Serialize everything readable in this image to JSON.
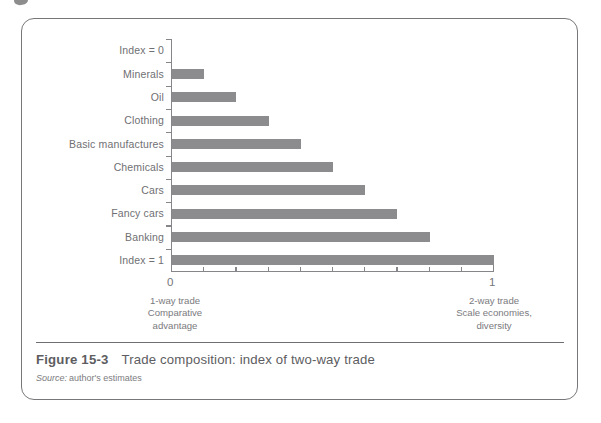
{
  "figure": {
    "number": "Figure 15-3",
    "title": "Trade composition: index of two-way trade",
    "source_label": "Source:",
    "source_text": "author's estimates",
    "border_color": "#77777a"
  },
  "chart_data": {
    "type": "bar",
    "orientation": "horizontal",
    "title": "Trade composition: index of two-way trade",
    "xlabel": "",
    "ylabel": "",
    "categories": [
      "Index = 0",
      "Minerals",
      "Oil",
      "Clothing",
      "Basic manufactures",
      "Chemicals",
      "Cars",
      "Fancy cars",
      "Banking",
      "Index = 1"
    ],
    "values": [
      0.0,
      0.1,
      0.2,
      0.3,
      0.4,
      0.5,
      0.6,
      0.7,
      0.8,
      1.0
    ],
    "xlim": [
      0,
      1
    ],
    "xticks": [
      0,
      0.1,
      0.2,
      0.3,
      0.4,
      0.5,
      0.6,
      0.7,
      0.8,
      0.9,
      1.0
    ],
    "xtick_labels": [
      "0",
      "",
      "",
      "",
      "",
      "",
      "",
      "",
      "",
      "",
      "1"
    ],
    "grid": false,
    "legend": null,
    "bar_color": "#8c8c8e",
    "axis_color": "#85858a",
    "annotations": [
      {
        "position": "left",
        "lines": [
          "1-way trade",
          "Comparative",
          "advantage"
        ]
      },
      {
        "position": "right",
        "lines": [
          "2-way trade",
          "Scale economies,",
          "diversity"
        ]
      }
    ]
  }
}
